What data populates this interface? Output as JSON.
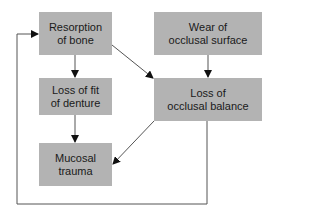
{
  "diagram": {
    "nodes": [
      {
        "id": "resorption",
        "lines": [
          "Resorption",
          "of bone"
        ]
      },
      {
        "id": "wear",
        "lines": [
          "Wear of",
          "occlusal surface"
        ]
      },
      {
        "id": "loss_fit",
        "lines": [
          "Loss of fit",
          "of denture"
        ]
      },
      {
        "id": "loss_balance",
        "lines": [
          "Loss of",
          "occlusal balance"
        ]
      },
      {
        "id": "mucosal",
        "lines": [
          "Mucosal",
          "trauma"
        ]
      }
    ],
    "edges": [
      {
        "from": "resorption",
        "to": "loss_fit"
      },
      {
        "from": "resorption",
        "to": "loss_balance"
      },
      {
        "from": "wear",
        "to": "loss_balance"
      },
      {
        "from": "loss_fit",
        "to": "mucosal"
      },
      {
        "from": "loss_balance",
        "to": "mucosal"
      },
      {
        "from": "loss_balance",
        "to": "resorption",
        "type": "feedback-loop"
      }
    ],
    "colors": {
      "box_fill": "#b3b3b3",
      "line": "#555555",
      "arrow": "#111111"
    }
  }
}
